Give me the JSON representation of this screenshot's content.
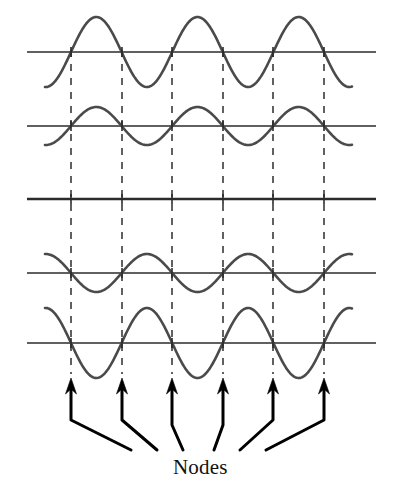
{
  "figure": {
    "label": "Nodes",
    "label_x": 173,
    "label_y": 455,
    "width": 394,
    "height": 488,
    "background": "#ffffff",
    "wave_color": "#4a4a4a",
    "axis_color": "#2b2b2b",
    "dash_color": "#3a3a3a",
    "arrow_color": "#000000"
  },
  "chart_data": {
    "type": "line",
    "title": "Nodes",
    "subtitle": "",
    "xlabel": "",
    "ylabel": "",
    "grid": false,
    "legend": "none",
    "x_range": [
      45,
      360
    ],
    "axis_x_start": 27,
    "axis_x_end": 376,
    "wave_x_start": 45,
    "wave_x_end": 352,
    "wavelength": 101.2,
    "phase_x0": 71,
    "node_positions": [
      71,
      122,
      172,
      223,
      273,
      324
    ],
    "node_count": 6,
    "series": [
      {
        "name": "snapshot-1",
        "baseline_y": 52,
        "amplitude": 35,
        "sign": 1,
        "kind": "wave"
      },
      {
        "name": "snapshot-2",
        "baseline_y": 126,
        "amplitude": 19,
        "sign": 1,
        "kind": "wave"
      },
      {
        "name": "snapshot-3",
        "baseline_y": 199,
        "amplitude": 0,
        "sign": 0,
        "kind": "flat"
      },
      {
        "name": "snapshot-4",
        "baseline_y": 273,
        "amplitude": 19,
        "sign": -1,
        "kind": "wave"
      },
      {
        "name": "snapshot-5",
        "baseline_y": 343,
        "amplitude": 35,
        "sign": -1,
        "kind": "wave"
      }
    ],
    "dashed_lines": {
      "y_top": 50,
      "y_bottom": 374,
      "dash": "7 7",
      "width": 1.6
    },
    "arrows": [
      {
        "tip_x": 71,
        "tip_y": 378,
        "elbow_x": 71,
        "elbow_y": 420,
        "tail_x": 131,
        "tail_y": 450
      },
      {
        "tip_x": 122,
        "tip_y": 378,
        "elbow_x": 122,
        "elbow_y": 420,
        "tail_x": 157,
        "tail_y": 450
      },
      {
        "tip_x": 172,
        "tip_y": 378,
        "elbow_x": 172,
        "elbow_y": 425,
        "tail_x": 183,
        "tail_y": 450
      },
      {
        "tip_x": 223,
        "tip_y": 378,
        "elbow_x": 223,
        "elbow_y": 425,
        "tail_x": 214,
        "tail_y": 450
      },
      {
        "tip_x": 273,
        "tip_y": 378,
        "elbow_x": 273,
        "elbow_y": 420,
        "tail_x": 240,
        "tail_y": 450
      },
      {
        "tip_x": 324,
        "tip_y": 378,
        "elbow_x": 324,
        "elbow_y": 420,
        "tail_x": 266,
        "tail_y": 450
      }
    ]
  }
}
